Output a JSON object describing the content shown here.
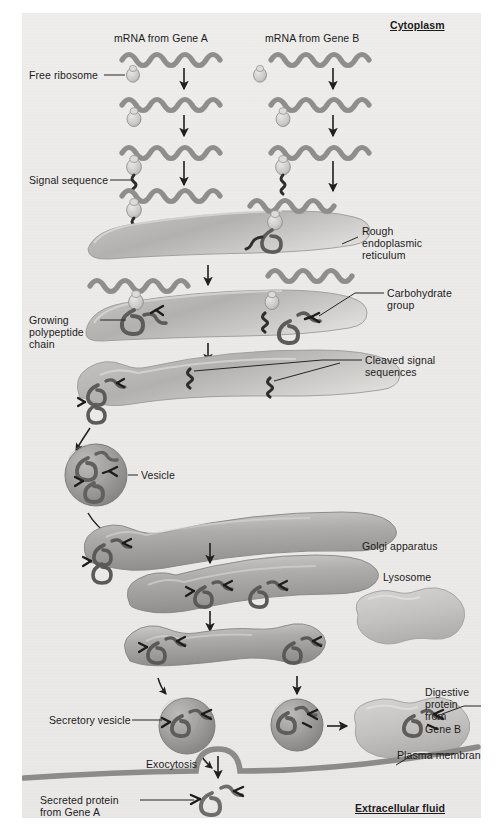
{
  "figure": {
    "background_color": "#ecebe9",
    "panel_border_color": "#ffffff"
  },
  "compartment_labels": {
    "cytoplasm": "Cytoplasm",
    "extracellular_fluid": "Extracellular fluid"
  },
  "top_labels": {
    "mrna_a": "mRNA from Gene A",
    "mrna_b": "mRNA from Gene B",
    "free_ribosome": "Free ribosome",
    "signal_sequence": "Signal sequence"
  },
  "organelle_labels": {
    "rough_er": "Rough\nendoplasmic\nreticulum",
    "rough_er_lines": [
      "Rough",
      "endoplasmic",
      "reticulum"
    ],
    "golgi": "Golgi apparatus",
    "lysosome": "Lysosome",
    "vesicle": "Vesicle",
    "secretory_vesicle": "Secretory vesicle",
    "plasma_membrane": "Plasma membrane"
  },
  "molecule_labels": {
    "growing_polypeptide": "Growing\npolypeptide\nchain",
    "growing_polypeptide_lines": [
      "Growing",
      "polypeptide",
      "chain"
    ],
    "carbohydrate_group": "Carbohydrate\ngroup",
    "carbohydrate_group_lines": [
      "Carbohydrate",
      "group"
    ],
    "cleaved_signal": "Cleaved signal\nsequences",
    "cleaved_signal_lines": [
      "Cleaved signal",
      "sequences"
    ],
    "digestive_protein": "Digestive\nprotein\nfrom\nGene B",
    "digestive_protein_lines": [
      "Digestive",
      "protein",
      "from",
      "Gene B"
    ],
    "secreted_protein": "Secreted protein\nfrom Gene A",
    "secreted_protein_lines": [
      "Secreted protein",
      "from Gene A"
    ],
    "exocytosis": "Exocytosis"
  },
  "colors": {
    "mrna": "#8e8e8e",
    "ribosome": "#cfcfcf",
    "signal_sequence": "#3a3a3a",
    "organelle_fill": "#b9b9b9",
    "organelle_light": "#d9d9d9",
    "vesicle_fill": "#9e9e9e",
    "lysosome_fill": "#c7c7c7",
    "membrane": "#8c8c8c",
    "protein": "#7b7b7b",
    "carbohydrate": "#1c1c1c",
    "arrow": "#1f1f1f",
    "text": "#1b1b1b"
  },
  "pathway_steps": [
    "mRNA from Gene A and Gene B in cytoplasm",
    "Free ribosome binds mRNA",
    "Signal sequence synthesized",
    "Ribosome docks on rough endoplasmic reticulum",
    "Growing polypeptide chain enters ER lumen",
    "Carbohydrate group added; signal sequences cleaved",
    "Transport vesicle buds from ER",
    "Vesicle fuses with Golgi apparatus",
    "Golgi processing across cisternae",
    "Secretory vesicle and lysosome-bound vesicle bud off",
    "Exocytosis releases secreted protein from Gene A",
    "Digestive protein from Gene B delivered to lysosome"
  ],
  "arrow_count": {
    "vertical_flow": 11,
    "curved": 4
  }
}
